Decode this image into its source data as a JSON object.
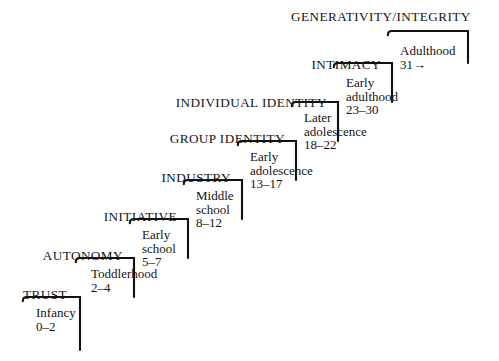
{
  "diagram": {
    "title": "GENERATIVITY/INTEGRITY",
    "arrow_glyph": "→",
    "line_color": "#111111",
    "background_color": "#ffffff",
    "steps": [
      {
        "stage": "TRUST",
        "period": "Infancy",
        "ages": "0–2",
        "stage_x": 74,
        "stage_y": 288,
        "period_x": 36,
        "period_y": 306,
        "tread_x1": 27,
        "tread_x2": 80,
        "tread_y": 297,
        "riser_y2": 350
      },
      {
        "stage": "AUTONOMY",
        "period": "Toddlerhood",
        "ages": "2–4",
        "stage_x": 130,
        "stage_y": 249,
        "period_x": 91,
        "period_y": 267,
        "tread_x1": 80,
        "tread_x2": 134,
        "tread_y": 258,
        "riser_y2": 297
      },
      {
        "stage": "INITIATIVE",
        "period": "Early school",
        "ages": "5–7",
        "stage_x": 184,
        "stage_y": 210,
        "period_x": 142,
        "period_y": 228,
        "tread_x1": 134,
        "tread_x2": 188,
        "tread_y": 219,
        "riser_y2": 258
      },
      {
        "stage": "INDUSTRY",
        "period": "Middle school",
        "ages": "8–12",
        "stage_x": 238,
        "stage_y": 171,
        "period_x": 196,
        "period_y": 189,
        "tread_x1": 188,
        "tread_x2": 242,
        "tread_y": 180,
        "riser_y2": 219
      },
      {
        "stage": "GROUP IDENTITY",
        "period": "Early adolescence",
        "ages": "13–17",
        "stage_x": 292,
        "stage_y": 132,
        "period_x": 250,
        "period_y": 150,
        "tread_x1": 242,
        "tread_x2": 296,
        "tread_y": 141,
        "riser_y2": 180
      },
      {
        "stage": "INDIVIDUAL IDENTITY",
        "period": "Later adolescence",
        "ages": "18–22",
        "stage_x": 334,
        "stage_y": 96,
        "period_x": 304,
        "period_y": 111,
        "tread_x1": 296,
        "tread_x2": 338,
        "tread_y": 102,
        "riser_y2": 141
      },
      {
        "stage": "INTIMACY",
        "period": "Early adulthood",
        "ages": "23–30",
        "stage_x": 388,
        "stage_y": 58,
        "period_x": 346,
        "period_y": 76,
        "tread_x1": 338,
        "tread_x2": 392,
        "tread_y": 63,
        "riser_y2": 102
      },
      {
        "stage": "",
        "period": "Adulthood",
        "ages": "31→",
        "stage_x": 0,
        "stage_y": 0,
        "period_x": 400,
        "period_y": 44,
        "tread_x1": 392,
        "tread_x2": 468,
        "tread_y": 31,
        "riser_y2": 63
      }
    ],
    "title_x": 291,
    "title_y": 10
  }
}
